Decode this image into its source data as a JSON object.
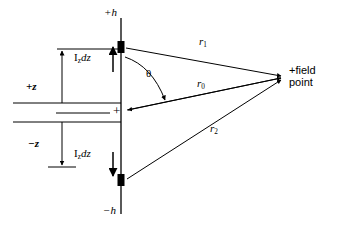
{
  "figure": {
    "type": "antenna-dipole-geometry-diagram",
    "background_color": "#ffffff",
    "line_color": "#000000",
    "width": 337,
    "height": 232
  },
  "labels": {
    "plus_h": "+h",
    "minus_h": "−h",
    "plus_z": "+z",
    "minus_z": "−z",
    "current_element_top_main": "I",
    "current_element_top_sub": "z",
    "current_element_top_tail": "dz",
    "current_element_bottom_main": "I",
    "current_element_bottom_sub": "z",
    "current_element_bottom_tail": "dz",
    "theta": "θ",
    "r1_main": "r",
    "r1_sub": "1",
    "r0_main": "r",
    "r0_sub": "0",
    "r2_main": "r",
    "r2_sub": "2",
    "origin_plus": "+",
    "field_point_line1": "+field",
    "field_point_line2": "point"
  },
  "geometry": {
    "antenna_axis_x": 121,
    "antenna_top_y": 18,
    "antenna_bottom_y": 214,
    "origin_y": 113,
    "source_top_y": 47,
    "source_bottom_y": 180,
    "field_point_x": 282,
    "field_point_y": 78,
    "dim_arrow_x": 62,
    "box_left_x": 13,
    "upper_box_top_y": 49,
    "upper_box_bottom_y": 103,
    "lower_box_top_y": 122,
    "lower_box_bottom_y": 167
  }
}
